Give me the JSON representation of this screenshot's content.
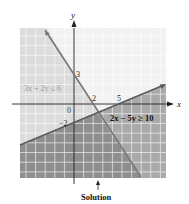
{
  "figure": {
    "axes": {
      "x_label": "x",
      "y_label": "y",
      "origin_label": "0"
    },
    "ticks": {
      "y_intercept_a": "3",
      "x_intercept_a": "2",
      "x_intercept_b": "5",
      "y_intercept_b": "−2"
    },
    "inequalities": [
      {
        "label": "3x + 2y ≤ 6",
        "color": "#9a9a9a"
      },
      {
        "label": "2x − 5y ≥ 10",
        "color": "#1a1a1a"
      }
    ],
    "solution_label": "Solution",
    "colors": {
      "light_region": "#e6e6e6",
      "dark_region": "#a8a8a8",
      "overlap_region": "#8f8f8f",
      "grid": "#ffffff",
      "line_a": "#7a7a7a",
      "line_b": "#5a5a5a"
    }
  }
}
